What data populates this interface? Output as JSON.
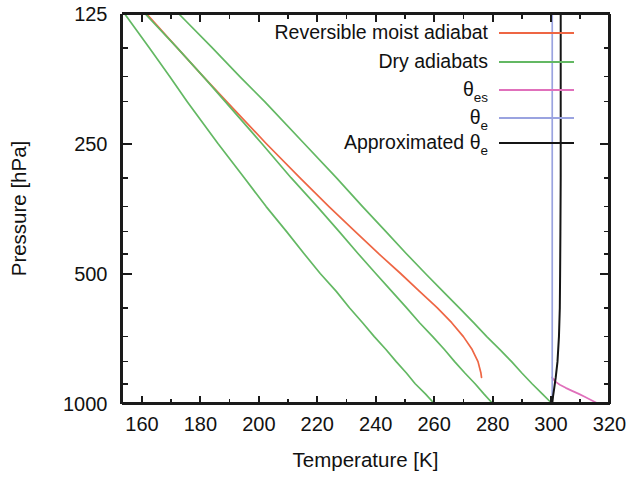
{
  "figure": {
    "background_color": "#ffffff",
    "axis_color": "#1a1a1a"
  },
  "chart_data": {
    "type": "line",
    "title": "",
    "xlabel": "Temperature [K]",
    "ylabel": "Pressure [hPa]",
    "xlim": [
      153,
      320
    ],
    "ylim": [
      125,
      1000
    ],
    "yscale": "log-inverted",
    "xticks": [
      160,
      180,
      200,
      220,
      240,
      260,
      280,
      300,
      320
    ],
    "xticklabels": [
      "160",
      "180",
      "200",
      "220",
      "240",
      "260",
      "280",
      "300",
      "320"
    ],
    "yticks": [
      125,
      250,
      500,
      1000
    ],
    "yticklabels": [
      "125",
      "250",
      "500",
      "1000"
    ],
    "yminorticks": [
      150,
      175,
      200,
      300,
      350,
      400,
      450,
      600,
      700,
      800,
      900
    ],
    "grid": false,
    "legend_position": "upper-right-inside",
    "series": [
      {
        "name": "Reversible moist adiabat",
        "color": "#ee6644",
        "linewidth": 1.7,
        "points": [
          [
            125,
            161.5
          ],
          [
            150,
            172.0
          ],
          [
            175,
            181.0
          ],
          [
            200,
            189.0
          ],
          [
            250,
            202.5
          ],
          [
            300,
            214.0
          ],
          [
            350,
            224.0
          ],
          [
            400,
            233.0
          ],
          [
            450,
            241.0
          ],
          [
            500,
            248.5
          ],
          [
            550,
            255.0
          ],
          [
            600,
            261.0
          ],
          [
            650,
            266.0
          ],
          [
            700,
            270.0
          ],
          [
            750,
            273.0
          ],
          [
            800,
            275.0
          ],
          [
            850,
            276.0
          ],
          [
            870,
            276.2
          ]
        ]
      },
      {
        "name": "Dry adiabats",
        "color": "#63b863",
        "linewidth": 1.7,
        "curves": [
          {
            "label": "dry-adiabat-cold",
            "points": [
              [
                125,
                154.0
              ],
              [
                150,
                162.5
              ],
              [
                175,
                169.5
              ],
              [
                200,
                175.5
              ],
              [
                250,
                186.0
              ],
              [
                300,
                195.0
              ],
              [
                350,
                202.5
              ],
              [
                400,
                209.5
              ],
              [
                450,
                215.5
              ],
              [
                500,
                221.0
              ],
              [
                550,
                226.5
              ],
              [
                600,
                231.0
              ],
              [
                650,
                235.5
              ],
              [
                700,
                239.5
              ],
              [
                750,
                243.5
              ],
              [
                800,
                247.0
              ],
              [
                850,
                250.5
              ],
              [
                900,
                253.5
              ],
              [
                950,
                257.0
              ],
              [
                1000,
                260.0
              ]
            ]
          },
          {
            "label": "dry-adiabat-warm",
            "points": [
              [
                125,
                161.0
              ],
              [
                150,
                172.0
              ],
              [
                175,
                181.0
              ],
              [
                200,
                188.5
              ],
              [
                250,
                201.0
              ],
              [
                300,
                211.0
              ],
              [
                350,
                220.0
              ],
              [
                400,
                227.5
              ],
              [
                450,
                234.0
              ],
              [
                500,
                240.0
              ],
              [
                550,
                245.5
              ],
              [
                600,
                250.5
              ],
              [
                650,
                255.0
              ],
              [
                700,
                259.5
              ],
              [
                750,
                263.5
              ],
              [
                800,
                267.0
              ],
              [
                850,
                270.5
              ],
              [
                900,
                274.0
              ],
              [
                950,
                277.0
              ],
              [
                1000,
                280.0
              ]
            ]
          },
          {
            "label": "dry-adiabat-hot",
            "points": [
              [
                125,
                172.5
              ],
              [
                150,
                184.0
              ],
              [
                175,
                193.5
              ],
              [
                200,
                202.0
              ],
              [
                250,
                215.5
              ],
              [
                300,
                226.5
              ],
              [
                350,
                235.5
              ],
              [
                400,
                243.5
              ],
              [
                450,
                250.5
              ],
              [
                500,
                257.0
              ],
              [
                550,
                263.0
              ],
              [
                600,
                268.5
              ],
              [
                650,
                273.5
              ],
              [
                700,
                278.0
              ],
              [
                750,
                282.5
              ],
              [
                800,
                286.5
              ],
              [
                850,
                290.0
              ],
              [
                900,
                293.5
              ],
              [
                950,
                297.0
              ],
              [
                1000,
                300.3
              ]
            ]
          }
        ]
      },
      {
        "name": "theta_es",
        "display": "θes",
        "color": "#e070bb",
        "linewidth": 1.7,
        "points": [
          [
            870,
            300.3
          ],
          [
            890,
            301.5
          ],
          [
            905,
            303.0
          ],
          [
            920,
            305.0
          ],
          [
            935,
            307.2
          ],
          [
            950,
            309.5
          ],
          [
            965,
            311.5
          ],
          [
            980,
            313.5
          ],
          [
            1000,
            316.0
          ]
        ]
      },
      {
        "name": "theta_e",
        "display": "θe",
        "color": "#9aa3e0",
        "linewidth": 1.7,
        "points": [
          [
            125,
            300.4
          ],
          [
            300,
            300.4
          ],
          [
            500,
            300.4
          ],
          [
            700,
            300.4
          ],
          [
            870,
            300.4
          ],
          [
            1000,
            300.4
          ]
        ]
      },
      {
        "name": "Approximated theta_e",
        "display": "Approximated θe",
        "color": "#151515",
        "linewidth": 2.0,
        "points": [
          [
            125,
            303.3
          ],
          [
            200,
            303.3
          ],
          [
            300,
            303.3
          ],
          [
            400,
            303.2
          ],
          [
            500,
            303.1
          ],
          [
            600,
            303.0
          ],
          [
            700,
            302.7
          ],
          [
            800,
            302.2
          ],
          [
            870,
            301.6
          ],
          [
            920,
            301.1
          ],
          [
            960,
            300.7
          ],
          [
            1000,
            300.4
          ]
        ]
      }
    ]
  },
  "legend": {
    "entries": [
      {
        "label": "Reversible moist adiabat",
        "sub": "",
        "color": "#ee6644",
        "width": 1.8
      },
      {
        "label": "Dry adiabats",
        "sub": "",
        "color": "#63b863",
        "width": 1.5
      },
      {
        "label": "θ",
        "sub": "es",
        "color": "#e070bb",
        "width": 1.8
      },
      {
        "label": "θ",
        "sub": "e",
        "color": "#9aa3e0",
        "width": 1.6
      },
      {
        "label": "Approximated θ",
        "sub": "e",
        "color": "#151515",
        "width": 2.4
      }
    ]
  }
}
